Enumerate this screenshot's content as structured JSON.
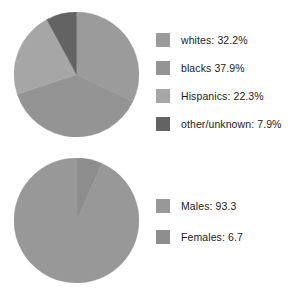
{
  "chart_data": [
    {
      "type": "pie",
      "title": "",
      "name": "race-ethnicity-distribution",
      "legend_position": "right",
      "start_angle_deg": 0,
      "direction": "clockwise",
      "unit": "%",
      "categories": [
        "whites",
        "blacks",
        "Hispanics",
        "other/unknown"
      ],
      "values": [
        32.2,
        37.9,
        22.3,
        7.9
      ],
      "labels": [
        "whites: 32.2%",
        "blacks 37.9%",
        "Hispanics: 22.3%",
        "other/unknown: 7.9%"
      ],
      "colors": [
        "#9b9b9b",
        "#949494",
        "#a6a6a6",
        "#636363"
      ]
    },
    {
      "type": "pie",
      "title": "",
      "name": "sex-distribution",
      "legend_position": "right",
      "start_angle_deg": 0,
      "direction": "counterclockwise",
      "unit": "",
      "categories": [
        "Males",
        "Females"
      ],
      "values": [
        93.3,
        6.7
      ],
      "labels": [
        "Males: 93.3",
        "Females: 6.7"
      ],
      "colors": [
        "#989898",
        "#8d8d8d"
      ]
    }
  ],
  "charts": {
    "race": {
      "legend": [
        {
          "label": "whites: 32.2%",
          "color": "#9b9b9b"
        },
        {
          "label": "blacks 37.9%",
          "color": "#949494"
        },
        {
          "label": "Hispanics: 22.3%",
          "color": "#a6a6a6"
        },
        {
          "label": "other/unknown: 7.9%",
          "color": "#636363"
        }
      ]
    },
    "sex": {
      "legend": [
        {
          "label": "Males: 93.3",
          "color": "#989898"
        },
        {
          "label": "Females: 6.7",
          "color": "#8d8d8d"
        }
      ]
    }
  }
}
